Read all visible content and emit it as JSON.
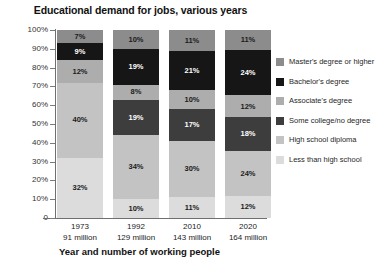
{
  "chart_data": {
    "type": "bar",
    "subtype": "100% stacked bar",
    "title": "Educational demand for jobs, various years",
    "xlabel": "Year and number of working people",
    "ylabel": "",
    "ylim": [
      0,
      100
    ],
    "yticks": [
      "0",
      "10%",
      "20%",
      "30%",
      "40%",
      "50%",
      "60%",
      "70%",
      "80%",
      "90%",
      "100%"
    ],
    "grid": false,
    "legend_position": "right",
    "categories": [
      "1973",
      "1992",
      "2010",
      "2020"
    ],
    "category_sublabels": [
      "91 million",
      "129 million",
      "143 million",
      "164 million"
    ],
    "stack_order_bottom_to_top": [
      "Less than high school",
      "High school diploma",
      "Some college/no degree",
      "Associate's degree",
      "Bachelor's degree",
      "Master's degree or higher"
    ],
    "series": [
      {
        "name": "Less than high school",
        "color": "#dcdcdc",
        "values": [
          32,
          10,
          11,
          12
        ],
        "labels": [
          "32%",
          "10%",
          "11%",
          "12%"
        ]
      },
      {
        "name": "High school diploma",
        "color": "#c3c3c3",
        "values": [
          40,
          34,
          30,
          24
        ],
        "labels": [
          "40%",
          "34%",
          "30%",
          "24%"
        ]
      },
      {
        "name": "Some college/no degree",
        "color": "#3d3d3d",
        "values": [
          0,
          19,
          17,
          18
        ],
        "labels": [
          "",
          "19%",
          "17%",
          "18%"
        ]
      },
      {
        "name": "Associate's degree",
        "color": "#adadad",
        "values": [
          12,
          8,
          10,
          12
        ],
        "labels": [
          "12%",
          "8%",
          "10%",
          "12%"
        ]
      },
      {
        "name": "Bachelor's degree",
        "color": "#161616",
        "values": [
          9,
          19,
          21,
          24
        ],
        "labels": [
          "9%",
          "19%",
          "21%",
          "24%"
        ]
      },
      {
        "name": "Master's degree or higher",
        "color": "#8c8c8c",
        "values": [
          7,
          10,
          11,
          11
        ],
        "labels": [
          "7%",
          "10%",
          "11%",
          "11%"
        ]
      }
    ]
  },
  "legend": {
    "items": [
      {
        "label": "Master's degree or higher",
        "color": "#8c8c8c"
      },
      {
        "label": "Bachelor's degree",
        "color": "#161616"
      },
      {
        "label": "Associate's degree",
        "color": "#adadad"
      },
      {
        "label": "Some college/no degree",
        "color": "#3d3d3d"
      },
      {
        "label": "High school diploma",
        "color": "#c3c3c3"
      },
      {
        "label": "Less than high school",
        "color": "#dcdcdc"
      }
    ]
  }
}
